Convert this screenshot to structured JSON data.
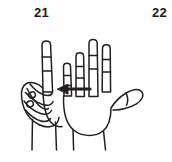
{
  "page": {
    "width": 172,
    "height": 162,
    "background_color": "#ffffff",
    "ink_color": "#231f20",
    "figure_type": "line-drawing"
  },
  "labels": [
    {
      "id": "label-21",
      "text": "21",
      "position": "top-left"
    },
    {
      "id": "label-22",
      "text": "22",
      "position": "top-right"
    }
  ],
  "figure": {
    "left_hand": {
      "name": "closed-fist-with-index-finger-extended",
      "description": "left hand fist, index finger pointing up, other fingers curled, thumb across"
    },
    "right_hand": {
      "name": "open-palm-four-fingers-extended",
      "description": "right hand open palm facing viewer, four fingers extended upward, thumb extended to the right"
    },
    "arrow": {
      "name": "left-pointing-arrow",
      "direction": "left",
      "x_start": 90,
      "x_end": 58,
      "y": 89
    }
  }
}
